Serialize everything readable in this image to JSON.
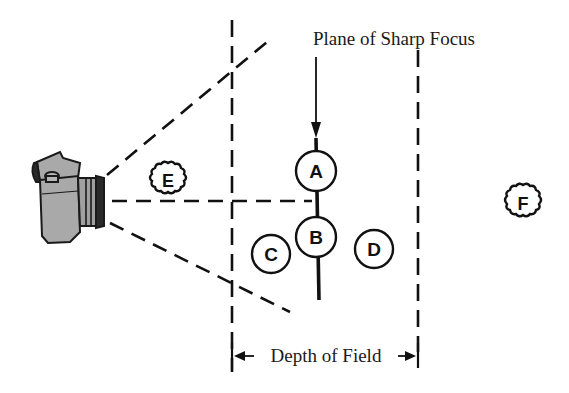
{
  "title": "Plane of Sharp Focus",
  "bottom_label": "Depth of Field",
  "colors": {
    "ink": "#111111",
    "camera_body": "#a9a9a9",
    "camera_dark": "#2a2a2a",
    "background": "#ffffff"
  },
  "subjects": [
    {
      "id": "A",
      "label": "A",
      "shape": "circle",
      "sharp": true
    },
    {
      "id": "B",
      "label": "B",
      "shape": "circle",
      "sharp": true
    },
    {
      "id": "C",
      "label": "C",
      "shape": "circle",
      "sharp": true
    },
    {
      "id": "D",
      "label": "D",
      "shape": "circle",
      "sharp": true
    },
    {
      "id": "E",
      "label": "E",
      "shape": "wavy-circle",
      "sharp": false
    },
    {
      "id": "F",
      "label": "F",
      "shape": "wavy-circle",
      "sharp": false
    }
  ],
  "icons": {
    "camera": "camera-icon"
  }
}
